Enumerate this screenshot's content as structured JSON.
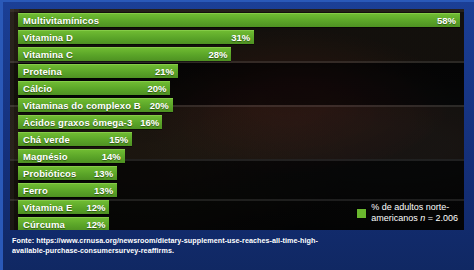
{
  "chart_data": {
    "type": "bar",
    "orientation": "horizontal",
    "title": "",
    "xlabel": "",
    "ylabel": "",
    "categories": [
      "Multivitamínicos",
      "Vitamina D",
      "Vitamina C",
      "Proteína",
      "Cálcio",
      "Vitaminas do complexo B",
      "Ácidos graxos ômega-3",
      "Chá verde",
      "Magnésio",
      "Probióticos",
      "Ferro",
      "Vitamina E",
      "Cúrcuma"
    ],
    "values": [
      58,
      31,
      28,
      21,
      20,
      20,
      16,
      15,
      14,
      13,
      13,
      12,
      12
    ],
    "value_labels": [
      "58%",
      "31%",
      "28%",
      "21%",
      "20%",
      "20%",
      "16%",
      "15%",
      "14%",
      "13%",
      "13%",
      "12%",
      "12%"
    ],
    "xlim": [
      0,
      58
    ],
    "grid": false,
    "legend_position": "bottom-right",
    "series_color": "#6ab72e"
  },
  "legend": {
    "swatch_color": "#6ab72e",
    "line1": "% de adultos norte-",
    "line2_prefix": "americanos ",
    "line2_italic": "n",
    "line2_suffix": " = 2.006"
  },
  "footer": {
    "source": "Fonte: https://www.crnusa.org/newsroom/dietary-supplement-use-reaches-all-time-high-available-purchase-consumersurvey-reaffirms."
  },
  "colors": {
    "frame": "#17398c",
    "panel": "#060708",
    "bar": "#6ab72e",
    "text": "#ffffff"
  }
}
